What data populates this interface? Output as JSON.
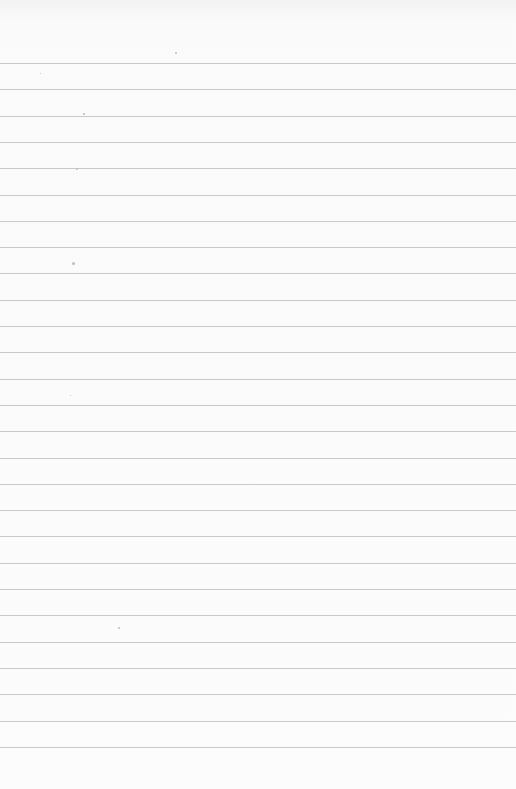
{
  "paper": {
    "type": "lined-sheet",
    "background_color": "#fbfbfb",
    "rule_color": "#c9c9c9",
    "first_rule_y": 63,
    "rule_spacing": 26.3,
    "rule_count": 27,
    "text": ""
  }
}
